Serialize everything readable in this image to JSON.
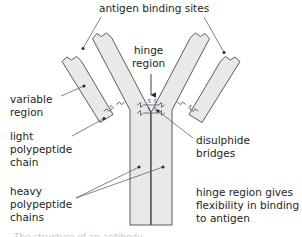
{
  "diagram": {
    "colors": {
      "shape_fill": "#e9e9e9",
      "shape_stroke": "#4a4a4a",
      "leader_line": "#555555",
      "text": "#242424",
      "background": "#ffffff"
    },
    "labels": {
      "antigen_binding_sites": "antigen binding sites",
      "hinge_region": "hinge\nregion",
      "variable_region": "variable\nregion",
      "light_polypeptide_chain": "light\npolypeptide\nchain",
      "heavy_polypeptide_chains": "heavy\npolypeptide\nchains",
      "disulphide_bridges": "disulphide\nbridges",
      "hinge_region_note": "hinge region gives\nflexibility in binding\nto antigen",
      "cropped_caption": "The structure of an antibody"
    },
    "parts": [
      {
        "name": "light-chain-left",
        "type": "polypeptide",
        "chain": "light"
      },
      {
        "name": "light-chain-right",
        "type": "polypeptide",
        "chain": "light"
      },
      {
        "name": "heavy-chain-left",
        "type": "polypeptide",
        "chain": "heavy"
      },
      {
        "name": "heavy-chain-right",
        "type": "polypeptide",
        "chain": "heavy"
      }
    ],
    "disulphide_bridges": [
      {
        "name": "bridge-left-diagonal",
        "symbol": "S-S",
        "orientation": "diagonal"
      },
      {
        "name": "bridge-right-diagonal",
        "symbol": "S-S",
        "orientation": "diagonal"
      },
      {
        "name": "bridge-hinge-upper",
        "symbol": "S-S",
        "orientation": "horizontal"
      },
      {
        "name": "bridge-hinge-lower",
        "symbol": "S-S",
        "orientation": "horizontal"
      }
    ]
  }
}
